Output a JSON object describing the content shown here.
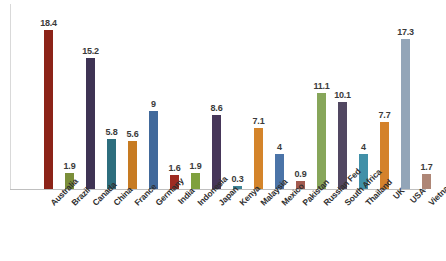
{
  "chart_data": {
    "type": "bar",
    "title": "",
    "subtitle": "",
    "xlabel": "",
    "ylabel": "",
    "ylim": [
      0,
      20
    ],
    "grid": false,
    "legend": false,
    "categories": [
      "Australia",
      "Brazil",
      "Canada",
      "China",
      "France",
      "Germany",
      "India",
      "Indonesia",
      "Japan",
      "Kenya",
      "Malaysia",
      "Mexico",
      "Pakistan",
      "Russian Fed",
      "South Africa",
      "Thailand",
      "UK",
      "USA",
      "Vietnam"
    ],
    "values": [
      18.4,
      1.9,
      15.2,
      5.8,
      5.6,
      9,
      1.6,
      1.9,
      8.6,
      0.3,
      7.1,
      4,
      0.9,
      11.1,
      10.1,
      4,
      7.7,
      17.3,
      1.7
    ],
    "value_labels": [
      "18.4",
      "1.9",
      "15.2",
      "5.8",
      "5.6",
      "9",
      "1.6",
      "1.9",
      "8.6",
      "0.3",
      "7.1",
      "4",
      "0.9",
      "11.1",
      "10.1",
      "4",
      "7.7",
      "17.3",
      "1.7"
    ],
    "colors": [
      "#8C2318",
      "#7B8F3A",
      "#3E3354",
      "#2D6E7E",
      "#C77B22",
      "#41699B",
      "#9E2B22",
      "#7FA03E",
      "#463659",
      "#3C8496",
      "#D4842A",
      "#4B74A8",
      "#A35B50",
      "#87A65A",
      "#514761",
      "#4190A8",
      "#D4822B",
      "#93A5B8",
      "#AE8676"
    ]
  },
  "axis": {
    "baseline_color": "#bfbfbf",
    "y_axis_color": "#d9d9d9"
  }
}
